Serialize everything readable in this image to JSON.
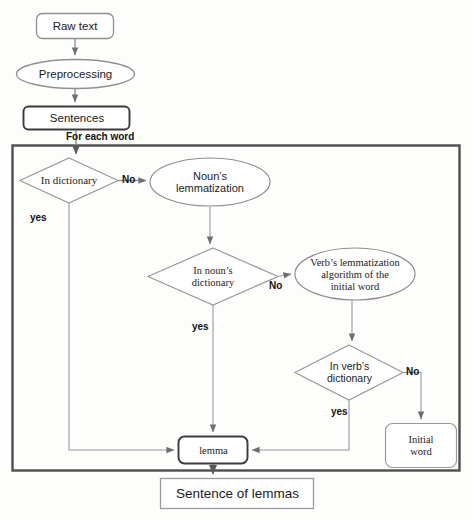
{
  "diagram": {
    "colors": {
      "outer_border": "#4d4d4d",
      "thin_stroke": "#8a8a8a",
      "thick_stroke": "#3b3b3b",
      "text": "#1a1a1a",
      "background": "#fdfdfc"
    },
    "nodes": {
      "raw_text": {
        "label": "Raw text",
        "shape": "rounded-rect"
      },
      "preprocessing": {
        "label": "Preprocessing",
        "shape": "ellipse"
      },
      "sentences": {
        "label": "Sentences",
        "shape": "rounded-rect"
      },
      "in_dictionary": {
        "label": "In dictionary",
        "shape": "diamond"
      },
      "noun_lemmatization": {
        "label_line1": "Noun’s",
        "label_line2": "lemmatization",
        "shape": "ellipse"
      },
      "in_noun_dictionary": {
        "label_line1": "In noun’s",
        "label_line2": "dictionary",
        "shape": "diamond"
      },
      "verb_lemmatization": {
        "label_line1": "Verb’s lemmatization",
        "label_line2": "algorithm of the",
        "label_line3": "initial word",
        "shape": "ellipse"
      },
      "in_verb_dictionary": {
        "label_line1": "In verb’s",
        "label_line2": "dictionary",
        "shape": "diamond"
      },
      "initial_word": {
        "label_line1": "Initial",
        "label_line2": "word",
        "shape": "rounded-rect"
      },
      "lemma": {
        "label": "lemma",
        "shape": "rounded-rect"
      },
      "sentence_of_lemmas": {
        "label": "Sentence of lemmas",
        "shape": "rect"
      }
    },
    "edge_labels": {
      "for_each_word": "For each word",
      "dictionary_no": "No",
      "dictionary_yes": "yes",
      "noun_dictionary_no": "No",
      "noun_dictionary_yes": "yes",
      "verb_dictionary_no": "No",
      "verb_dictionary_yes": "yes"
    },
    "loop_box": {
      "name": "for-each-word-loop-container"
    }
  }
}
